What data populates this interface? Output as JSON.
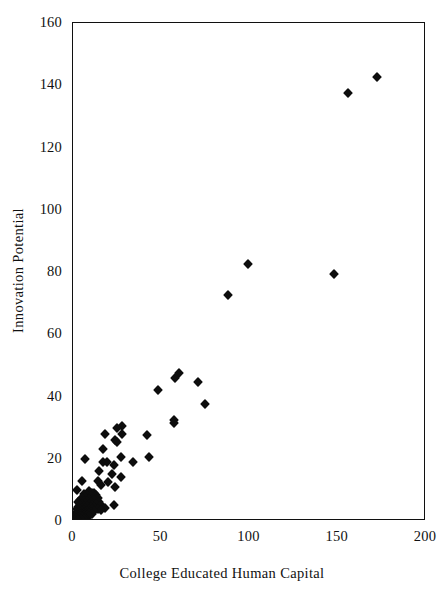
{
  "chart_data": {
    "type": "scatter",
    "title": "",
    "xlabel": "College Educated Human Capital",
    "ylabel": "Innovation Potential",
    "xlim": [
      0,
      200
    ],
    "ylim": [
      0,
      160
    ],
    "xticks": [
      0,
      50,
      100,
      150,
      200
    ],
    "yticks": [
      0,
      20,
      40,
      60,
      80,
      100,
      120,
      140,
      160
    ],
    "xtick_labels": [
      "0",
      "50",
      "100",
      "150",
      "200"
    ],
    "ytick_labels": [
      "0",
      "20",
      "40",
      "60",
      "80",
      "100",
      "120",
      "140",
      "160"
    ],
    "grid": false,
    "legend": false,
    "marker": "diamond",
    "marker_color": "#0d0d0d",
    "frame_color": "#101010",
    "background": "#ffffff",
    "n_points": 116,
    "series": [
      {
        "name": "cities",
        "points": [
          [
            172,
            142.5
          ],
          [
            156,
            137.5
          ],
          [
            99,
            82.5
          ],
          [
            148,
            79.5
          ],
          [
            88,
            72.5
          ],
          [
            60,
            47.5
          ],
          [
            58,
            46.0
          ],
          [
            71,
            44.5
          ],
          [
            48,
            42.0
          ],
          [
            75,
            37.5
          ],
          [
            57.5,
            32.5
          ],
          [
            57.5,
            31.5
          ],
          [
            28,
            30.5
          ],
          [
            25,
            30.0
          ],
          [
            28,
            28.0
          ],
          [
            18,
            28.0
          ],
          [
            42,
            27.5
          ],
          [
            24,
            26.0
          ],
          [
            25,
            25.5
          ],
          [
            17,
            23.0
          ],
          [
            27,
            20.5
          ],
          [
            43,
            20.5
          ],
          [
            7,
            20.0
          ],
          [
            34,
            19.0
          ],
          [
            17,
            19.0
          ],
          [
            19,
            19.0
          ],
          [
            23,
            18.0
          ],
          [
            15,
            16.0
          ],
          [
            22,
            15.0
          ],
          [
            27,
            14.0
          ],
          [
            5,
            13.0
          ],
          [
            14,
            13.0
          ],
          [
            20,
            12.5
          ],
          [
            16,
            11.5
          ],
          [
            24,
            11.0
          ],
          [
            2,
            10.0
          ],
          [
            9,
            9.5
          ],
          [
            11,
            9.0
          ],
          [
            12,
            9.0
          ],
          [
            6,
            8.8
          ],
          [
            13,
            8.5
          ],
          [
            8,
            8.3
          ],
          [
            10,
            8.0
          ],
          [
            7,
            7.8
          ],
          [
            14,
            7.5
          ],
          [
            5,
            7.5
          ],
          [
            11,
            7.2
          ],
          [
            9,
            7.0
          ],
          [
            4,
            6.9
          ],
          [
            12,
            6.8
          ],
          [
            6,
            6.5
          ],
          [
            8,
            6.5
          ],
          [
            15,
            6.2
          ],
          [
            10,
            6.0
          ],
          [
            3,
            6.0
          ],
          [
            7,
            5.8
          ],
          [
            13,
            5.6
          ],
          [
            5,
            5.5
          ],
          [
            9,
            5.4
          ],
          [
            11,
            5.2
          ],
          [
            4,
            5.0
          ],
          [
            16,
            5.0
          ],
          [
            23,
            5.0
          ],
          [
            6,
            4.9
          ],
          [
            8,
            4.8
          ],
          [
            12,
            4.6
          ],
          [
            3,
            4.5
          ],
          [
            10,
            4.4
          ],
          [
            18,
            4.3
          ],
          [
            5,
            4.2
          ],
          [
            7,
            4.1
          ],
          [
            14,
            4.0
          ],
          [
            2,
            4.0
          ],
          [
            9,
            3.9
          ],
          [
            4,
            3.8
          ],
          [
            11,
            3.7
          ],
          [
            6,
            3.6
          ],
          [
            16,
            3.5
          ],
          [
            3,
            3.4
          ],
          [
            8,
            3.3
          ],
          [
            5,
            3.2
          ],
          [
            12,
            3.1
          ],
          [
            2,
            3.0
          ],
          [
            7,
            3.0
          ],
          [
            10,
            2.9
          ],
          [
            4,
            2.8
          ],
          [
            6,
            2.7
          ],
          [
            3,
            2.6
          ],
          [
            9,
            2.5
          ],
          [
            5,
            2.4
          ],
          [
            2,
            2.3
          ],
          [
            7,
            2.2
          ],
          [
            4,
            2.1
          ],
          [
            11,
            2.1
          ],
          [
            3,
            2.0
          ],
          [
            6,
            1.9
          ],
          [
            1.5,
            1.9
          ],
          [
            8,
            1.8
          ],
          [
            5,
            1.7
          ],
          [
            2,
            1.6
          ],
          [
            4,
            1.5
          ],
          [
            9,
            1.5
          ],
          [
            3,
            1.4
          ],
          [
            6,
            1.3
          ],
          [
            1,
            1.3
          ],
          [
            5,
            1.2
          ],
          [
            2.5,
            1.1
          ],
          [
            7,
            1.0
          ],
          [
            4,
            1.0
          ],
          [
            1.5,
            0.9
          ],
          [
            3,
            0.8
          ],
          [
            6,
            0.7
          ],
          [
            2,
            0.6
          ],
          [
            4.5,
            0.5
          ],
          [
            1,
            0.4
          ],
          [
            3,
            0.3
          ]
        ]
      }
    ]
  }
}
